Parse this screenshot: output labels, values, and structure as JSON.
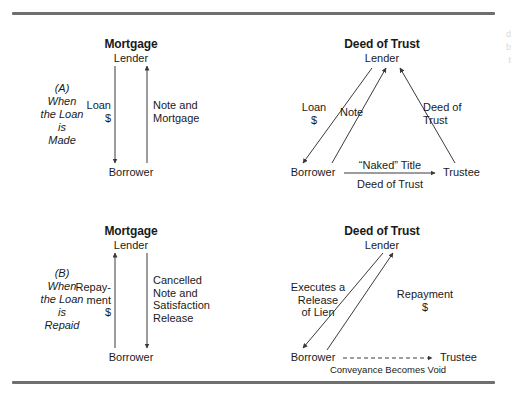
{
  "figure": {
    "background": "#ffffff",
    "rule_color": "#6f6f6f",
    "line_color": "#3a3a3a"
  },
  "margin_note": {
    "line1": "d",
    "line2": "b",
    "line3": "t"
  },
  "sections": [
    {
      "id": "A",
      "stage_label": "(A)\nWhen\nthe Loan\nis\nMade",
      "mortgage": {
        "title": "Mortgage",
        "top_node": "Lender",
        "bottom_node": "Borrower",
        "left_edge_label": "Loan\n$",
        "right_edge_label": "Note and\nMortgage"
      },
      "deed": {
        "title": "Deed of Trust",
        "top_node": "Lender",
        "bottom_left_node": "Borrower",
        "bottom_right_node": "Trustee",
        "left_edge_label": "Loan\n$",
        "middle_edge_label": "Note",
        "right_edge_label": "Deed of\nTrust",
        "base_label_above": "“Naked” Title",
        "base_label_below": "Deed of Trust"
      }
    },
    {
      "id": "B",
      "stage_label": "(B)\nWhen\nthe Loan\nis\nRepaid",
      "mortgage": {
        "title": "Mortgage",
        "top_node": "Lender",
        "bottom_node": "Borrower",
        "left_edge_label": "Repay-\nment\n$",
        "right_edge_label": "Cancelled\nNote and\nSatisfaction\nRelease"
      },
      "deed": {
        "title": "Deed of Trust",
        "top_node": "Lender",
        "bottom_left_node": "Borrower",
        "bottom_right_node": "Trustee",
        "left_edge_label": "Executes a\nRelease\nof Lien",
        "right_edge_label": "Repayment\n$",
        "base_label_below": "Conveyance Becomes Void"
      }
    }
  ]
}
